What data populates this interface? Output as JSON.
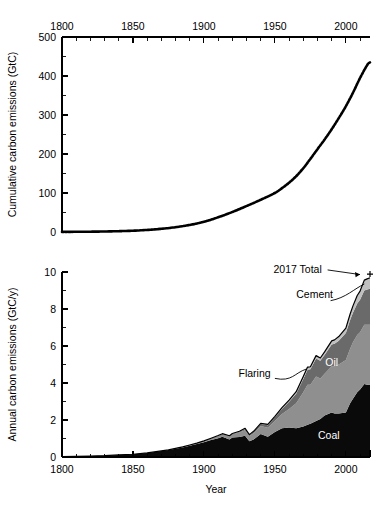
{
  "figure": {
    "name": "global-carbon-emissions-figure",
    "background": "#ffffff"
  },
  "colors": {
    "coal": "#0a0a0a",
    "oil": "#8f8f8f",
    "gas": "#6a6a6a",
    "cement": "#c0c0c0",
    "flaring": "#a8a8a8",
    "line": "#000000",
    "axis": "#000000"
  },
  "chart_data": [
    {
      "id": "cumulative-panel",
      "type": "line",
      "title": "",
      "xlabel": "",
      "ylabel": "Cumulative carbon emissions (GtC)",
      "xlim": [
        1800,
        2017
      ],
      "ylim": [
        0,
        500
      ],
      "xticks": [
        1800,
        1850,
        1900,
        1950,
        2000
      ],
      "xticklabels": [
        "1800",
        "1850",
        "1900",
        "1950",
        "2000"
      ],
      "xminor_step": 10,
      "yticks": [
        0,
        100,
        200,
        300,
        400,
        500
      ],
      "yticklabels": [
        "0",
        "100",
        "200",
        "300",
        "400",
        "500"
      ],
      "yminor_step": 50,
      "xaxis_position": "top",
      "grid": false,
      "legend": "none",
      "linestyle": "dotted-thick",
      "series": [
        {
          "name": "Cumulative total carbon emissions",
          "x": [
            1800,
            1810,
            1820,
            1830,
            1840,
            1850,
            1860,
            1870,
            1880,
            1890,
            1900,
            1910,
            1920,
            1930,
            1940,
            1950,
            1955,
            1960,
            1965,
            1970,
            1975,
            1980,
            1985,
            1990,
            1995,
            2000,
            2005,
            2010,
            2015,
            2017
          ],
          "values": [
            0.3,
            0.5,
            0.8,
            1.3,
            2.1,
            3.3,
            5.3,
            8.2,
            12.3,
            18.1,
            26.1,
            37.7,
            51.2,
            66.5,
            82.6,
            100.0,
            112.5,
            126.5,
            143.0,
            163.5,
            187.5,
            212.5,
            237.0,
            263.5,
            292.0,
            322.5,
            357.0,
            395.0,
            428.0,
            435.0
          ]
        }
      ]
    },
    {
      "id": "annual-panel",
      "type": "area",
      "title": "",
      "xlabel": "Year",
      "ylabel": "Annual carbon emissions (GtC/y)",
      "xlim": [
        1800,
        2017
      ],
      "ylim": [
        0,
        10
      ],
      "xticks": [
        1800,
        1850,
        1900,
        1950,
        2000
      ],
      "xticklabels": [
        "1800",
        "1850",
        "1900",
        "1950",
        "2000"
      ],
      "xminor_step": 10,
      "yticks": [
        0,
        2,
        4,
        6,
        8,
        10
      ],
      "yticklabels": [
        "0",
        "2",
        "4",
        "6",
        "8",
        "10"
      ],
      "yminor_step": 1,
      "xaxis_position": "bottom",
      "grid": false,
      "legend": "inline-labels",
      "stacked": true,
      "x": [
        1800,
        1810,
        1820,
        1830,
        1840,
        1850,
        1860,
        1870,
        1875,
        1880,
        1885,
        1890,
        1895,
        1900,
        1905,
        1910,
        1913,
        1918,
        1920,
        1925,
        1929,
        1932,
        1935,
        1940,
        1945,
        1950,
        1955,
        1960,
        1965,
        1970,
        1973,
        1975,
        1979,
        1982,
        1985,
        1990,
        1992,
        1995,
        2000,
        2003,
        2005,
        2008,
        2010,
        2013,
        2015,
        2017
      ],
      "series": [
        {
          "name": "Coal",
          "label": "Coal",
          "color": "#0a0a0a",
          "label_xy": [
            1988,
            1.0
          ],
          "values": [
            0.02,
            0.03,
            0.05,
            0.07,
            0.11,
            0.15,
            0.22,
            0.32,
            0.38,
            0.45,
            0.52,
            0.61,
            0.7,
            0.8,
            0.92,
            1.02,
            1.1,
            0.95,
            1.05,
            1.08,
            1.15,
            0.85,
            0.95,
            1.25,
            1.1,
            1.35,
            1.55,
            1.6,
            1.55,
            1.65,
            1.75,
            1.8,
            1.95,
            2.05,
            2.25,
            2.4,
            2.35,
            2.35,
            2.4,
            2.9,
            3.15,
            3.5,
            3.65,
            3.95,
            3.9,
            3.9
          ]
        },
        {
          "name": "Oil",
          "label": "Oil",
          "color": "#8f8f8f",
          "label_xy": [
            1990,
            4.9
          ],
          "values": [
            0.0,
            0.0,
            0.0,
            0.0,
            0.0,
            0.0,
            0.0,
            0.01,
            0.01,
            0.02,
            0.03,
            0.04,
            0.05,
            0.06,
            0.08,
            0.11,
            0.13,
            0.16,
            0.18,
            0.24,
            0.3,
            0.28,
            0.33,
            0.42,
            0.48,
            0.6,
            0.78,
            1.0,
            1.35,
            1.85,
            2.15,
            2.1,
            2.4,
            2.2,
            2.25,
            2.5,
            2.55,
            2.65,
            2.85,
            2.95,
            3.05,
            3.1,
            3.1,
            3.2,
            3.25,
            3.25
          ]
        },
        {
          "name": "Gas",
          "label": "Gas",
          "color": "#6a6a6a",
          "label_xy": [
            1990,
            7.6
          ],
          "values": [
            0.0,
            0.0,
            0.0,
            0.0,
            0.0,
            0.0,
            0.0,
            0.0,
            0.0,
            0.0,
            0.0,
            0.0,
            0.0,
            0.01,
            0.01,
            0.02,
            0.02,
            0.03,
            0.03,
            0.05,
            0.07,
            0.06,
            0.08,
            0.11,
            0.14,
            0.2,
            0.27,
            0.38,
            0.52,
            0.72,
            0.82,
            0.85,
            0.98,
            0.95,
            1.02,
            1.18,
            1.22,
            1.28,
            1.45,
            1.55,
            1.6,
            1.7,
            1.75,
            1.85,
            1.9,
            1.95
          ]
        },
        {
          "name": "Cement",
          "label": "Cement",
          "color": "#c0c0c0",
          "label_xy": [
            1978,
            8.6
          ],
          "values": [
            0.0,
            0.0,
            0.0,
            0.0,
            0.0,
            0.0,
            0.0,
            0.0,
            0.0,
            0.0,
            0.0,
            0.0,
            0.0,
            0.0,
            0.0,
            0.01,
            0.01,
            0.01,
            0.01,
            0.01,
            0.02,
            0.01,
            0.02,
            0.02,
            0.02,
            0.02,
            0.03,
            0.04,
            0.05,
            0.07,
            0.08,
            0.08,
            0.1,
            0.11,
            0.12,
            0.16,
            0.17,
            0.19,
            0.23,
            0.29,
            0.33,
            0.39,
            0.43,
            0.52,
            0.54,
            0.55
          ]
        },
        {
          "name": "Flaring",
          "label": "Flaring",
          "color": "#a8a8a8",
          "label_xy": [
            1947,
            4.35
          ],
          "label_anchor": "end",
          "values": [
            0.0,
            0.0,
            0.0,
            0.0,
            0.0,
            0.0,
            0.0,
            0.0,
            0.0,
            0.0,
            0.0,
            0.0,
            0.0,
            0.0,
            0.0,
            0.0,
            0.0,
            0.0,
            0.0,
            0.01,
            0.01,
            0.01,
            0.01,
            0.02,
            0.02,
            0.03,
            0.04,
            0.05,
            0.06,
            0.06,
            0.06,
            0.05,
            0.05,
            0.04,
            0.04,
            0.04,
            0.04,
            0.04,
            0.04,
            0.04,
            0.04,
            0.04,
            0.04,
            0.04,
            0.04,
            0.04
          ]
        }
      ],
      "annotations": [
        {
          "name": "2017-total-annotation",
          "text": "2017 Total",
          "text_xy": [
            1966,
            9.95
          ],
          "point_xy": [
            2017,
            9.7
          ],
          "marker": "plus"
        }
      ]
    }
  ]
}
